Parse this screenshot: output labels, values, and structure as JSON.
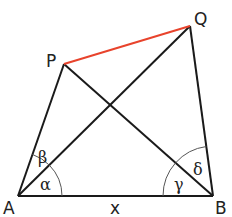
{
  "diagram": {
    "type": "geometry-quadrilateral",
    "points": {
      "A": {
        "label": "A",
        "x": 18,
        "y": 196
      },
      "B": {
        "label": "B",
        "x": 213,
        "y": 196
      },
      "P": {
        "label": "P",
        "x": 64,
        "y": 64
      },
      "Q": {
        "label": "Q",
        "x": 190,
        "y": 26
      }
    },
    "segments": [
      {
        "from": "A",
        "to": "B",
        "color": "#1a1a1a"
      },
      {
        "from": "A",
        "to": "P",
        "color": "#1a1a1a"
      },
      {
        "from": "A",
        "to": "Q",
        "color": "#1a1a1a"
      },
      {
        "from": "B",
        "to": "P",
        "color": "#1a1a1a"
      },
      {
        "from": "B",
        "to": "Q",
        "color": "#1a1a1a"
      },
      {
        "from": "P",
        "to": "Q",
        "color": "#e8432c"
      }
    ],
    "base_label": "x",
    "angles": {
      "alpha": "α",
      "beta": "β",
      "gamma": "γ",
      "delta": "δ"
    },
    "colors": {
      "line": "#1a1a1a",
      "highlight": "#e8432c",
      "arc": "#555555"
    }
  }
}
